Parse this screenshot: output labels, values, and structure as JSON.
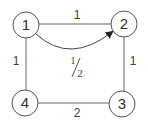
{
  "diagram": {
    "type": "weighted graph",
    "nodes": [
      {
        "id": "1",
        "label": "1",
        "cx": 26,
        "cy": 25
      },
      {
        "id": "2",
        "label": "2",
        "cx": 124,
        "cy": 24
      },
      {
        "id": "3",
        "label": "3",
        "cx": 122,
        "cy": 104
      },
      {
        "id": "4",
        "label": "4",
        "cx": 25,
        "cy": 103
      }
    ],
    "edges": [
      {
        "from": "1",
        "to": "2",
        "weight": "1",
        "directed": false
      },
      {
        "from": "2",
        "to": "3",
        "weight": "1",
        "directed": false
      },
      {
        "from": "3",
        "to": "4",
        "weight": "2",
        "directed": false
      },
      {
        "from": "4",
        "to": "1",
        "weight": "1",
        "directed": false
      },
      {
        "from": "1",
        "to": "2",
        "weight": "1/2",
        "directed": true,
        "curved": true
      }
    ],
    "labels": {
      "n1": "1",
      "n2": "2",
      "n3": "3",
      "n4": "4",
      "e12": "1",
      "e23": "1",
      "e34": "2",
      "e41": "1",
      "curve_num": "1",
      "curve_den": "2"
    },
    "colors": {
      "stroke": "#555555",
      "text": "#333333",
      "background": "#ffffff"
    }
  }
}
